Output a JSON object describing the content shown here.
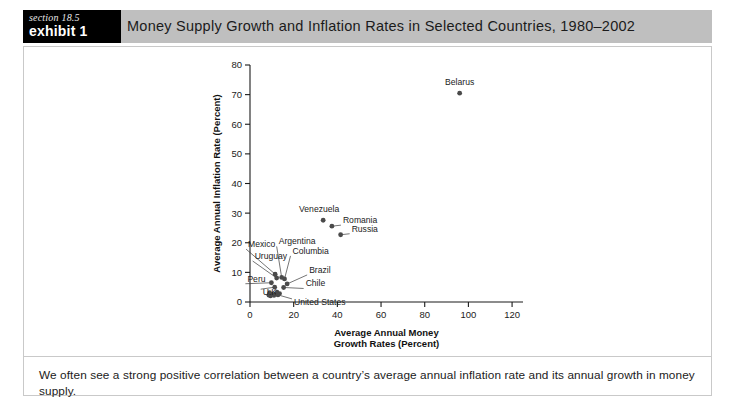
{
  "header": {
    "badge_section": "section 18.5",
    "badge_exhibit": "exhibit 1",
    "title": "Money Supply Growth and Inflation Rates in Selected Countries, 1980–2002"
  },
  "caption": "We often see a strong positive correlation between a country’s average annual inflation rate and its annual growth in money supply.",
  "chart_data": {
    "type": "scatter",
    "title": "",
    "xlabel_line1": "Average Annual Money",
    "xlabel_line2": "Growth Rates (Percent)",
    "ylabel": "Average Annual Inflation Rate (Percent)",
    "xlim": [
      0,
      125
    ],
    "ylim": [
      0,
      80
    ],
    "xticks": [
      0,
      20,
      40,
      60,
      80,
      100,
      120
    ],
    "yticks": [
      0,
      10,
      20,
      30,
      40,
      50,
      60,
      70,
      80
    ],
    "grid": false,
    "legend": "none",
    "points": [
      {
        "label": "Belarus",
        "x": 96,
        "y": 70.5,
        "label_dx": 0,
        "label_dy": -8,
        "anchor": "middle",
        "leader": false
      },
      {
        "label": "Venezuela",
        "x": 33.5,
        "y": 27.6,
        "label_dx": -4,
        "label_dy": -8,
        "anchor": "middle",
        "leader": false
      },
      {
        "label": "Romania",
        "x": 37.5,
        "y": 25.6,
        "label_dx": 11,
        "label_dy": -3,
        "anchor": "start",
        "leader": true
      },
      {
        "label": "Russia",
        "x": 41.5,
        "y": 22.7,
        "label_dx": 11,
        "label_dy": -3,
        "anchor": "start",
        "leader": true
      },
      {
        "label": "Mexico",
        "x": 11.5,
        "y": 9.4,
        "label_dx": -27,
        "label_dy": -27,
        "anchor": "start",
        "leader": true
      },
      {
        "label": "Uruguay",
        "x": 12.2,
        "y": 8.1,
        "label_dx": -22,
        "label_dy": -19,
        "anchor": "start",
        "leader": true
      },
      {
        "label": "Argentina",
        "x": 14.5,
        "y": 8.3,
        "label_dx": -3,
        "label_dy": -33,
        "anchor": "start",
        "leader": true
      },
      {
        "label": "Columbia",
        "x": 15.8,
        "y": 7.8,
        "label_dx": 8,
        "label_dy": -25,
        "anchor": "start",
        "leader": true
      },
      {
        "label": "Brazil",
        "x": 17.0,
        "y": 6.1,
        "label_dx": 22,
        "label_dy": -11,
        "anchor": "start",
        "leader": true
      },
      {
        "label": "Chile",
        "x": 15.4,
        "y": 4.9,
        "label_dx": 22,
        "label_dy": -1,
        "anchor": "start",
        "leader": true
      },
      {
        "label": "Peru",
        "x": 9.8,
        "y": 6.5,
        "label_dx": -24,
        "label_dy": -1,
        "anchor": "start",
        "leader": true
      },
      {
        "label": "U.K.",
        "x": 11.3,
        "y": 5.0,
        "label_dx": -12,
        "label_dy": 8,
        "anchor": "start",
        "leader": true
      },
      {
        "label": "United States",
        "x": 12.8,
        "y": 2.4,
        "label_dx": 16,
        "label_dy": 10,
        "anchor": "start",
        "leader": true
      }
    ],
    "extra_points": [
      {
        "x": 8.6,
        "y": 2.3
      },
      {
        "x": 9.4,
        "y": 2.0
      },
      {
        "x": 10.2,
        "y": 2.6
      },
      {
        "x": 11.0,
        "y": 2.2
      },
      {
        "x": 11.9,
        "y": 2.8
      },
      {
        "x": 13.6,
        "y": 2.9
      },
      {
        "x": 9.0,
        "y": 3.2
      },
      {
        "x": 12.4,
        "y": 3.4
      }
    ]
  }
}
